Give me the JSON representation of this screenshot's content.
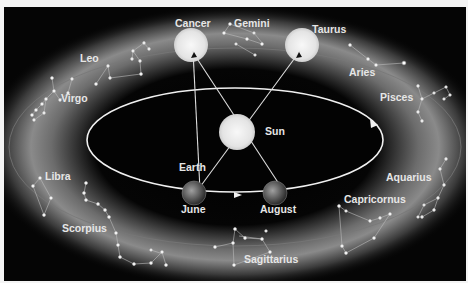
{
  "diagram": {
    "center_body": {
      "label": "Sun",
      "color": "#ececec"
    },
    "earth_positions": [
      {
        "label": "June",
        "caption": "Earth",
        "points_to": "Gemini/Cancer side"
      },
      {
        "label": "August",
        "caption": "",
        "points_to": "Cancer/Taurus side"
      }
    ],
    "earth_label": "Earth",
    "sun_images": [
      {
        "label": "Cancer"
      },
      {
        "label": "Taurus"
      }
    ],
    "orbit_direction": "counter-clockwise (arrows)",
    "constellations": [
      {
        "name": "Cancer"
      },
      {
        "name": "Gemini"
      },
      {
        "name": "Taurus"
      },
      {
        "name": "Aries"
      },
      {
        "name": "Pisces"
      },
      {
        "name": "Aquarius"
      },
      {
        "name": "Capricornus"
      },
      {
        "name": "Sagittarius"
      },
      {
        "name": "Scorpius"
      },
      {
        "name": "Libra"
      },
      {
        "name": "Virgo"
      },
      {
        "name": "Leo"
      }
    ],
    "labels": {
      "sun": "Sun",
      "earth": "Earth",
      "june": "June",
      "august": "August",
      "cancer": "Cancer",
      "gemini": "Gemini",
      "taurus": "Taurus",
      "aries": "Aries",
      "pisces": "Pisces",
      "aquarius": "Aquarius",
      "capricornus": "Capricornus",
      "sagittarius": "Sagittarius",
      "scorpius": "Scorpius",
      "libra": "Libra",
      "virgo": "Virgo",
      "leo": "Leo"
    },
    "colors": {
      "background": "#050505",
      "orbit": "#f0f0f0",
      "zodiac_band": "#9a9a9a",
      "sun": "#ececec",
      "label": "#e6e6e6"
    }
  }
}
